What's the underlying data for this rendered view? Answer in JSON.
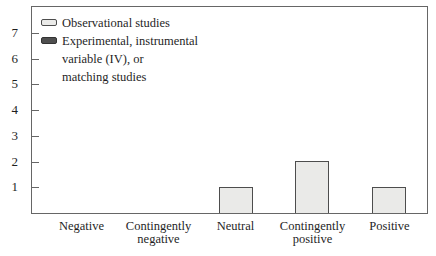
{
  "colors": {
    "background": "#ffffff",
    "frame": "#666666",
    "axis_text": "#1f1f1f",
    "observational_fill": "#eaeae8",
    "observational_border": "#4d4d4d",
    "experimental_fill": "#4f4f4f",
    "experimental_border": "#333333"
  },
  "legend": {
    "items": [
      {
        "label": "Observational studies",
        "series": "observational"
      },
      {
        "label": "Experimental, instrumental\nvariable (IV), or\nmatching studies",
        "series": "experimental"
      }
    ]
  },
  "chart_data": {
    "type": "bar",
    "title": "",
    "xlabel": "",
    "ylabel": "",
    "categories": [
      "Negative",
      "Contingently\nnegative",
      "Neutral",
      "Contingently\npositive",
      "Positive"
    ],
    "series": [
      {
        "name": "Observational studies",
        "values": [
          0,
          0,
          1,
          2,
          1
        ]
      },
      {
        "name": "Experimental, instrumental variable (IV), or matching studies",
        "values": [
          0,
          0,
          0,
          0,
          0
        ]
      }
    ],
    "ylim": [
      0,
      8
    ],
    "yticks": [
      1,
      2,
      3,
      4,
      5,
      6,
      7
    ],
    "grid": false,
    "legend_position": "top-left-inside"
  }
}
